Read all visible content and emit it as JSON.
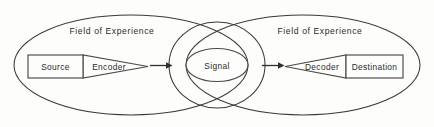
{
  "diagram": {
    "background_color": "#fdfdfc",
    "line_color": "#3a3a3a",
    "text_color": "#2b2b2b",
    "fields": [
      {
        "label": "Field of Experience",
        "side": "left"
      },
      {
        "label": "Field of Experience",
        "side": "right"
      }
    ],
    "nodes": [
      {
        "id": "source",
        "label": "Source",
        "shape": "rectangle"
      },
      {
        "id": "encoder",
        "label": "Encoder",
        "shape": "funnel-right"
      },
      {
        "id": "signal",
        "label": "Signal",
        "shape": "ellipse"
      },
      {
        "id": "decoder",
        "label": "Decoder",
        "shape": "funnel-left"
      },
      {
        "id": "destination",
        "label": "Destination",
        "shape": "rectangle"
      }
    ],
    "arrows": [
      {
        "id": "encoder-to-signal",
        "direction": "right"
      },
      {
        "id": "signal-to-decoder",
        "direction": "right"
      }
    ]
  }
}
